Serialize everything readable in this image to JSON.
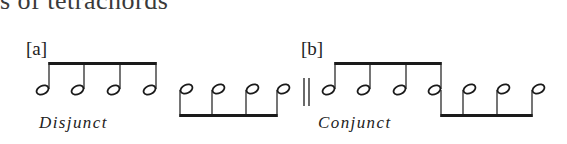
{
  "heading": {
    "text": "s of tetrachords"
  },
  "examples": [
    {
      "label": "[a]",
      "caption": "Disjunct"
    },
    {
      "label": "[b]",
      "caption": "Conjunct"
    }
  ],
  "notation": {
    "ink_color": "#1a1a1a",
    "groups": [
      {
        "id": "a-upper",
        "stem_dir": "up",
        "stems_x": [
          49,
          84,
          120,
          156
        ],
        "note_y": 90,
        "beam_y": 62
      },
      {
        "id": "a-lower",
        "stem_dir": "down",
        "stems_x": [
          180,
          212,
          246,
          277
        ],
        "note_y": 89,
        "beam_y": 117
      },
      {
        "id": "b-upper",
        "stem_dir": "up",
        "stems_x": [
          335,
          370,
          406,
          441
        ],
        "note_y": 90,
        "beam_y": 62
      },
      {
        "id": "b-lower",
        "stem_dir": "down",
        "stems_x": [
          441,
          463,
          497,
          532
        ],
        "note_y": 89,
        "beam_y": 117
      }
    ],
    "double_bar_x": [
      304,
      309
    ]
  }
}
